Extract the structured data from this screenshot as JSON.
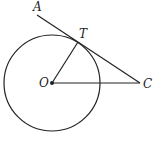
{
  "diagram": {
    "type": "geometry",
    "colors": {
      "stroke": "#222222",
      "background": "#ffffff"
    },
    "circle": {
      "center_label": "O",
      "cx": 52,
      "cy": 83,
      "r": 48
    },
    "points": {
      "A": {
        "label": "A",
        "x": 37,
        "y": 14
      },
      "T": {
        "label": "T",
        "x": 78,
        "y": 42
      },
      "O": {
        "label": "O",
        "x": 52,
        "y": 83
      },
      "C": {
        "label": "C",
        "x": 140,
        "y": 83
      }
    },
    "segments": [
      {
        "from": "A",
        "to": "C",
        "name": "tangent-line-AC"
      },
      {
        "from": "O",
        "to": "T",
        "name": "radius-OT"
      },
      {
        "from": "O",
        "to": "C",
        "name": "segment-OC"
      }
    ]
  }
}
